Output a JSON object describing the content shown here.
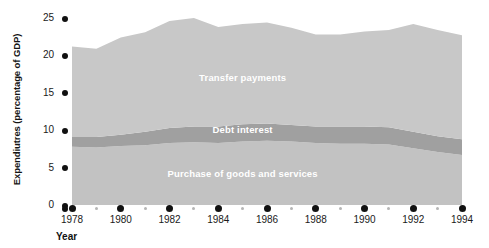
{
  "chart_data": {
    "type": "area",
    "stacked": true,
    "title": "",
    "xlabel": "Year",
    "ylabel": "Expendiutres (percentage of GDP)",
    "xlim": [
      1978,
      1994
    ],
    "ylim": [
      0,
      25
    ],
    "yticks": [
      0,
      5,
      10,
      15,
      20,
      25
    ],
    "xticks_major": [
      1978,
      1980,
      1982,
      1984,
      1986,
      1988,
      1990,
      1992,
      1994
    ],
    "xticks_minor": [
      1979,
      1981,
      1983,
      1985,
      1987,
      1989,
      1991,
      1993
    ],
    "grid": false,
    "legend": "inline-band-labels",
    "x": [
      1978,
      1979,
      1980,
      1981,
      1982,
      1983,
      1984,
      1985,
      1986,
      1987,
      1988,
      1989,
      1990,
      1991,
      1992,
      1993,
      1994
    ],
    "series": [
      {
        "name": "Purchase of goods and services",
        "color": "#c2c2c2",
        "label_color": "#ffffff",
        "values": [
          7.8,
          7.7,
          7.9,
          8.0,
          8.3,
          8.4,
          8.3,
          8.5,
          8.6,
          8.5,
          8.3,
          8.2,
          8.2,
          8.1,
          7.6,
          7.1,
          6.7
        ]
      },
      {
        "name": "Debt interest",
        "color": "#a0a0a0",
        "label_color": "#ffffff",
        "values": [
          1.3,
          1.4,
          1.5,
          1.8,
          2.0,
          2.1,
          2.2,
          2.3,
          2.3,
          2.2,
          2.2,
          2.3,
          2.3,
          2.3,
          2.2,
          2.1,
          2.1
        ]
      },
      {
        "name": "Transfer payments",
        "color": "#c8c8c8",
        "label_color": "#ffffff",
        "values": [
          12.1,
          11.8,
          13.0,
          13.3,
          14.3,
          14.5,
          13.3,
          13.4,
          13.5,
          13.0,
          12.3,
          12.3,
          12.7,
          13.0,
          14.4,
          14.2,
          13.9
        ]
      }
    ],
    "cumulative_top": [
      21.2,
      20.9,
      22.4,
      23.1,
      24.6,
      25.0,
      23.8,
      24.2,
      24.4,
      23.7,
      22.8,
      22.8,
      23.2,
      23.4,
      24.2,
      23.4,
      22.7
    ],
    "annotations": [
      {
        "text": "Transfer payments",
        "at_year": 1985,
        "at_value": 17.0
      },
      {
        "text": "Debt interest",
        "at_year": 1985,
        "at_value": 10.0
      },
      {
        "text": "Purchase of goods and services",
        "at_year": 1985,
        "at_value": 4.2
      }
    ]
  },
  "axes": {
    "y_title": "Expendiutres (percentage of GDP)",
    "x_title": "Year",
    "y_tick_labels": [
      "25",
      "20",
      "15",
      "10",
      "5",
      "0"
    ],
    "x_tick_labels": [
      "1978",
      "1980",
      "1982",
      "1984",
      "1986",
      "1988",
      "1990",
      "1992",
      "1994"
    ]
  },
  "colors": {
    "background": "#ffffff",
    "band_purchase": "#c2c2c2",
    "band_debt": "#a0a0a0",
    "band_transfer": "#c8c8c8",
    "tick_dot": "#111111",
    "minor_dot": "#b5b5b5",
    "text": "#1a1a1a",
    "band_label_text": "#ffffff"
  }
}
